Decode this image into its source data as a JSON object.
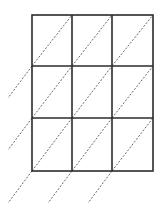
{
  "diagram": {
    "type": "lattice-multiplication-grid",
    "rows": 3,
    "columns": 3,
    "grid": {
      "left": 32,
      "top": 15,
      "right": 153,
      "bottom": 171,
      "column_x": [
        32,
        72,
        112,
        153
      ],
      "row_y": [
        15,
        66,
        118,
        171
      ]
    },
    "diagonal_style": "dashed",
    "diagonal_direction": "bottom-left to top-right",
    "extension": {
      "dx": -24,
      "dy": 32
    },
    "colors": {
      "grid_line": "#2b2b2b",
      "diagonal_line": "#555555",
      "background": "#ffffff"
    }
  }
}
